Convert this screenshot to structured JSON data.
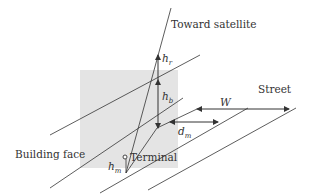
{
  "diagram": {
    "type": "geometry-illustration",
    "labels": {
      "satellite": "Toward satellite",
      "street": "Street",
      "building_face": "Building face",
      "terminal": "Terminal",
      "h_r": "h",
      "h_r_sub": "r",
      "h_b": "h",
      "h_b_sub": "b",
      "h_m": "h",
      "h_m_sub": "m",
      "d_m": "d",
      "d_m_sub": "m",
      "w": "W"
    },
    "colors": {
      "line": "#333333",
      "building_fill": "#e4e4e4",
      "background": "#ffffff"
    }
  }
}
